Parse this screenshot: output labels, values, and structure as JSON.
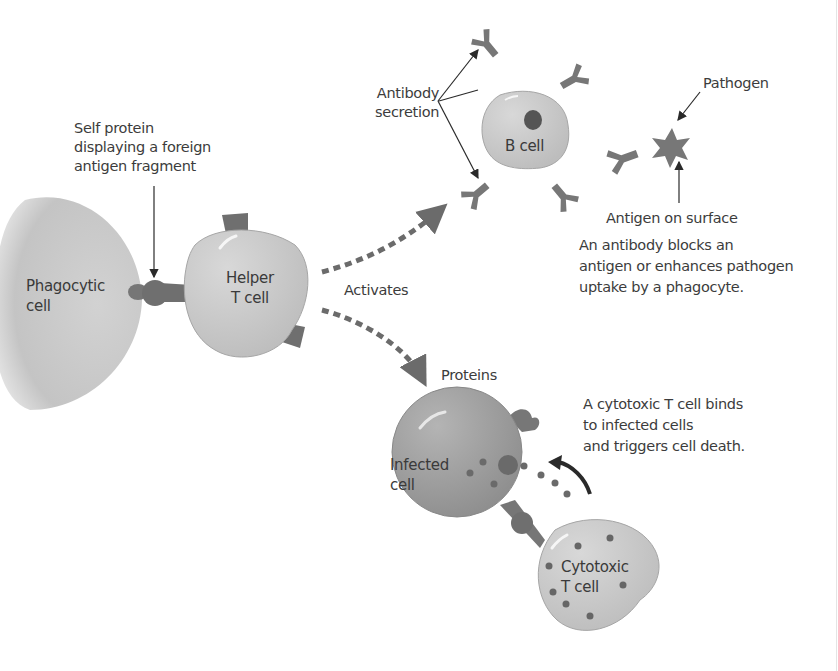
{
  "diagram": {
    "title": "",
    "colors": {
      "cell_fill": "#c9c9c9",
      "cell_edge": "#a6a6a6",
      "infected_fill": "#9f9f9f",
      "protein": "#6e6e6e",
      "arrow_dashed": "#6b6b6b",
      "leader_line": "#2a2a2a",
      "text": "#3c3c3c"
    },
    "cells": {
      "phagocytic": "Phagocytic cell",
      "phagocytic_line1": "Phagocytic",
      "phagocytic_line2": "cell",
      "helper_line1": "Helper",
      "helper_line2": "T cell",
      "b_cell": "B cell",
      "infected_line1": "Infected",
      "infected_line2": "cell",
      "cytotoxic_line1": "Cytotoxic",
      "cytotoxic_line2": "T cell"
    },
    "labels": {
      "self_protein_line1": "Self protein",
      "self_protein_line2": "displaying a foreign",
      "self_protein_line3": "antigen fragment",
      "antibody_line1": "Antibody",
      "antibody_line2": "secretion",
      "pathogen": "Pathogen",
      "antigen_surface": "Antigen on surface",
      "antibody_desc_line1": "An antibody blocks an",
      "antibody_desc_line2": "antigen or enhances pathogen",
      "antibody_desc_line3": "uptake by a phagocyte.",
      "activates": "Activates",
      "proteins": "Proteins",
      "cytotoxic_desc_line1": "A cytotoxic T cell binds",
      "cytotoxic_desc_line2": "to infected cells",
      "cytotoxic_desc_line3": "and triggers cell death."
    },
    "icons": {
      "antibody": "y-shaped-antibody-icon",
      "pathogen": "star-pathogen-icon",
      "receptor": "t-cell-receptor-icon"
    }
  }
}
